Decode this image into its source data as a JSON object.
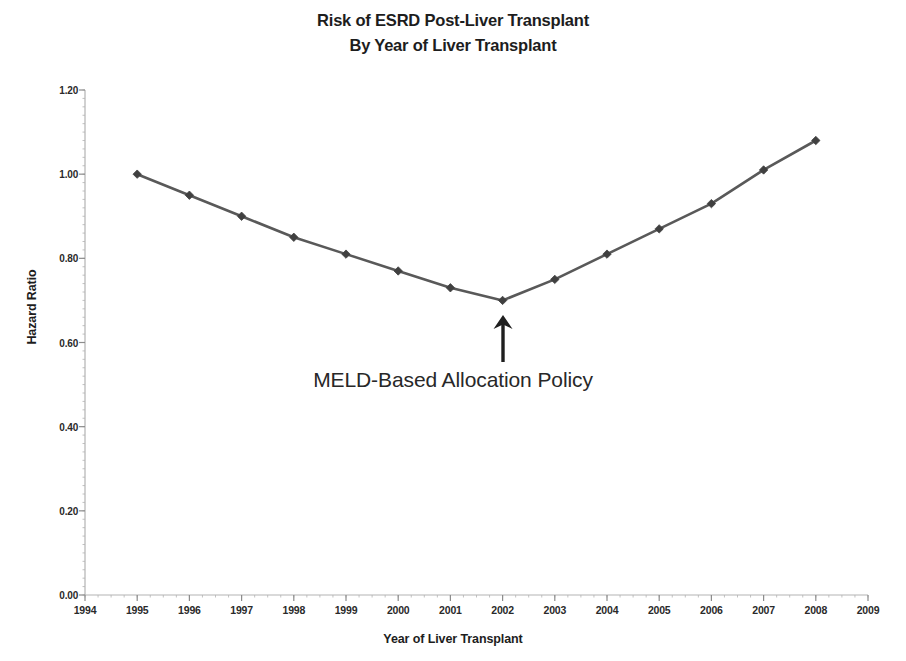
{
  "chart_data": {
    "type": "line",
    "title": "Risk of ESRD Post-Liver Transplant\nBy Year of Liver Transplant",
    "title_lines": [
      "Risk of ESRD Post-Liver Transplant",
      "By Year of Liver Transplant"
    ],
    "xlabel": "Year of Liver Transplant",
    "ylabel": "Hazard Ratio",
    "x": [
      1995,
      1996,
      1997,
      1998,
      1999,
      2000,
      2001,
      2002,
      2003,
      2004,
      2005,
      2006,
      2007,
      2008
    ],
    "values": [
      1.0,
      0.95,
      0.9,
      0.85,
      0.81,
      0.77,
      0.73,
      0.7,
      0.75,
      0.81,
      0.87,
      0.93,
      1.01,
      1.08
    ],
    "series": [
      {
        "name": "Hazard Ratio",
        "values": [
          1.0,
          0.95,
          0.9,
          0.85,
          0.81,
          0.77,
          0.73,
          0.7,
          0.75,
          0.81,
          0.87,
          0.93,
          1.01,
          1.08
        ]
      }
    ],
    "xlim": [
      1994,
      2009
    ],
    "ylim": [
      0.0,
      1.2
    ],
    "x_ticks": [
      1994,
      1995,
      1996,
      1997,
      1998,
      1999,
      2000,
      2001,
      2002,
      2003,
      2004,
      2005,
      2006,
      2007,
      2008,
      2009
    ],
    "x_tick_labels": [
      "1994",
      "1995",
      "1996",
      "1997",
      "1998",
      "1999",
      "2000",
      "2001",
      "2002",
      "2003",
      "2004",
      "2005",
      "2006",
      "2007",
      "2008",
      "2009"
    ],
    "y_ticks": [
      0.0,
      0.2,
      0.4,
      0.6,
      0.8,
      1.0,
      1.2
    ],
    "y_tick_labels": [
      "0.00",
      "0.20",
      "0.40",
      "0.60",
      "0.80",
      "1.00",
      "1.20"
    ],
    "grid": false,
    "legend": false,
    "legend_position": "none",
    "marker": "diamond",
    "line_color": "#595959",
    "marker_color": "#404040",
    "axis_color": "#b3b3b3",
    "annotations": [
      {
        "text": "MELD-Based Allocation Policy",
        "points_to_x": 2002,
        "points_to_y": 0.7,
        "arrow": "up-arrow"
      }
    ]
  },
  "axis": {
    "y_title": "Hazard Ratio",
    "x_title": "Year of Liver Transplant"
  },
  "annotation": {
    "text": "MELD-Based Allocation Policy",
    "arrow_icon": "up-arrow-icon"
  }
}
